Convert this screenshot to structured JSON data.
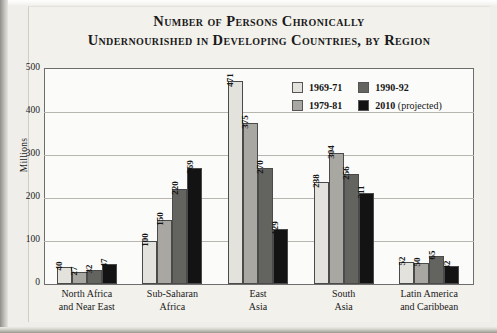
{
  "chart_data": {
    "type": "bar",
    "title": "Number of Persons Chronically Undernourished in Developing Countries, by Region",
    "title_line_1": "Number of Persons Chronically",
    "title_line_2": "Undernourished in Developing Countries, by Region",
    "xlabel": "",
    "ylabel": "Millions",
    "ylim": [
      0,
      500
    ],
    "yticks": [
      500,
      400,
      300,
      200,
      100,
      0
    ],
    "grid": true,
    "legend_position": "inside-top-right",
    "categories": [
      "North Africa and Near East",
      "Sub-Saharan Africa",
      "East Asia",
      "South Asia",
      "Latin America and Caribbean"
    ],
    "category_lines": [
      [
        "North Africa",
        "and Near East"
      ],
      [
        "Sub-Saharan",
        "Africa"
      ],
      [
        "East",
        "Asia"
      ],
      [
        "South",
        "Asia"
      ],
      [
        "Latin America",
        "and Caribbean"
      ]
    ],
    "series": [
      {
        "name": "1969-71",
        "color": "#e3e2dc",
        "values": [
          40,
          100,
          471,
          238,
          52
        ]
      },
      {
        "name": "1979-81",
        "color": "#a8a7a2",
        "values": [
          27,
          150,
          375,
          304,
          50
        ]
      },
      {
        "name": "1990-92",
        "color": "#636360",
        "values": [
          32,
          220,
          270,
          256,
          65
        ]
      },
      {
        "name": "2010 (projected)",
        "color": "#131313",
        "values": [
          47,
          269,
          129,
          211,
          42
        ]
      }
    ]
  },
  "legend": {
    "items": [
      {
        "label": "1969-71",
        "suffix": "",
        "color": "#e3e2dc"
      },
      {
        "label": "1990-92",
        "suffix": "",
        "color": "#636360"
      },
      {
        "label": "1979-81",
        "suffix": "",
        "color": "#a8a7a2"
      },
      {
        "label": "2010",
        "suffix": " (projected)",
        "color": "#131313"
      }
    ]
  },
  "axis": {
    "y_title": "Millions",
    "y_tick_500": "500",
    "y_tick_400": "400",
    "y_tick_300": "300",
    "y_tick_200": "200",
    "y_tick_100": "100",
    "y_tick_0": "0"
  }
}
